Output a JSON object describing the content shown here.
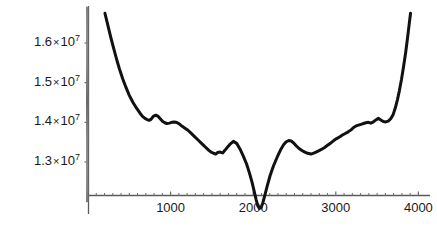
{
  "chart_data": {
    "type": "line",
    "title": "",
    "subtitle": "",
    "xlabel": "",
    "ylabel": "",
    "xlim": [
      0,
      4100
    ],
    "ylim": [
      11800000,
      16800000
    ],
    "grid": false,
    "legend": null,
    "axis_style": "mathematica-style axes with minor tick marks, no frame, no gridlines",
    "line_color": "#111111",
    "line_width": 3,
    "y_tick_values": [
      13000000,
      14000000,
      15000000,
      16000000
    ],
    "y_tick_labels": [
      {
        "mantissa": "1.3",
        "times": "×",
        "base": "10",
        "exponent": "7"
      },
      {
        "mantissa": "1.4",
        "times": "×",
        "base": "10",
        "exponent": "7"
      },
      {
        "mantissa": "1.5",
        "times": "×",
        "base": "10",
        "exponent": "7"
      },
      {
        "mantissa": "1.6",
        "times": "×",
        "base": "10",
        "exponent": "7"
      }
    ],
    "x_tick_values": [
      1000,
      2000,
      3000,
      4000
    ],
    "x_tick_labels": [
      "1000",
      "2000",
      "3000",
      "4000"
    ],
    "x_minor_tick_step": 100,
    "y_minor_tick_step": 25000,
    "series": [
      {
        "name": "curve",
        "x": [
          205,
          240,
          275,
          310,
          345,
          380,
          420,
          460,
          500,
          545,
          590,
          630,
          660,
          690,
          715,
          740,
          765,
          790,
          820,
          850,
          880,
          905,
          930,
          955,
          985,
          1015,
          1045,
          1075,
          1105,
          1140,
          1175,
          1210,
          1250,
          1290,
          1330,
          1365,
          1400,
          1430,
          1460,
          1490,
          1520,
          1545,
          1570,
          1600,
          1630,
          1660,
          1690,
          1720,
          1760,
          1800,
          1840,
          1880,
          1920,
          1955,
          1985,
          2010,
          2035,
          2055,
          2075,
          2095,
          2115,
          2140,
          2170,
          2205,
          2245,
          2290,
          2330,
          2370,
          2400,
          2430,
          2460,
          2490,
          2520,
          2555,
          2590,
          2625,
          2660,
          2700,
          2740,
          2780,
          2820,
          2860,
          2900,
          2940,
          2975,
          3010,
          3045,
          3080,
          3115,
          3150,
          3185,
          3215,
          3245,
          3275,
          3305,
          3335,
          3365,
          3395,
          3425,
          3455,
          3485,
          3515,
          3545,
          3575,
          3605,
          3635,
          3665,
          3695,
          3720,
          3745,
          3770,
          3795,
          3820,
          3845,
          3870,
          3890,
          3905
        ],
        "y": [
          16750000,
          16450000,
          16150000,
          15870000,
          15600000,
          15350000,
          15100000,
          14880000,
          14680000,
          14500000,
          14350000,
          14230000,
          14150000,
          14100000,
          14070000,
          14050000,
          14080000,
          14150000,
          14180000,
          14150000,
          14080000,
          14020000,
          13990000,
          13970000,
          13980000,
          14000000,
          14010000,
          13995000,
          13960000,
          13900000,
          13850000,
          13800000,
          13720000,
          13640000,
          13560000,
          13490000,
          13420000,
          13360000,
          13300000,
          13250000,
          13220000,
          13200000,
          13240000,
          13250000,
          13230000,
          13300000,
          13380000,
          13450000,
          13520000,
          13470000,
          13330000,
          13150000,
          12950000,
          12720000,
          12500000,
          12280000,
          12060000,
          11900000,
          11830000,
          11850000,
          11960000,
          12150000,
          12400000,
          12660000,
          12900000,
          13120000,
          13300000,
          13440000,
          13510000,
          13540000,
          13530000,
          13480000,
          13410000,
          13340000,
          13290000,
          13250000,
          13220000,
          13200000,
          13230000,
          13270000,
          13310000,
          13360000,
          13420000,
          13480000,
          13540000,
          13590000,
          13630000,
          13680000,
          13720000,
          13760000,
          13810000,
          13870000,
          13910000,
          13930000,
          13950000,
          13970000,
          13990000,
          14000000,
          13980000,
          14010000,
          14060000,
          14100000,
          14060000,
          14020000,
          14010000,
          14030000,
          14090000,
          14200000,
          14360000,
          14560000,
          14800000,
          15080000,
          15400000,
          15750000,
          16150000,
          16500000,
          16750000
        ]
      }
    ]
  }
}
